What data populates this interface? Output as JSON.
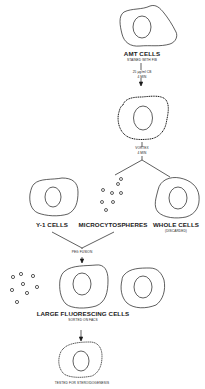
{
  "diagram": {
    "steps": {
      "amt": {
        "title": "AMT CELLS",
        "subtitle": "STAINED WITH FIB"
      },
      "treatment": {
        "line1": "25 μg/ml CB",
        "line2": "4 MIN"
      },
      "vortex": {
        "line1": "VORTEX",
        "line2": "4 MIN"
      },
      "y1": {
        "title": "Y-1 CELLS"
      },
      "microcytospheres": {
        "title": "MICROCYTOSPHERES"
      },
      "whole": {
        "title": "WHOLE CELLS",
        "subtitle": "(DISCARDED)"
      },
      "fusion": {
        "label": "PEG FUSION"
      },
      "large": {
        "title": "LARGE FLUORESCING CELLS",
        "subtitle": "SORTED ON FACS"
      },
      "final": {
        "label": "TESTED FOR STEROIDOGENESIS"
      }
    },
    "colors": {
      "stroke": "#1a1a1a",
      "background": "#ffffff"
    }
  }
}
